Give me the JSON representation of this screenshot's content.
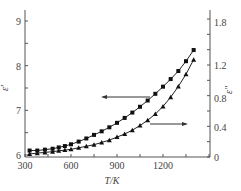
{
  "chart_data": {
    "type": "line",
    "title": "",
    "xlabel": "T/K",
    "ylabel": "ε′",
    "ylabel_right": "ε″",
    "xlim": [
      300,
      1500
    ],
    "ylim": [
      6,
      9.3
    ],
    "ylim_right": [
      0,
      1.9
    ],
    "x_ticks": [
      300,
      600,
      900,
      1200
    ],
    "y_ticks": [
      6,
      7,
      8,
      9
    ],
    "y_ticks_right": [
      0,
      0.4,
      0.8,
      1.2,
      1.8
    ],
    "grid": false,
    "series": [
      {
        "name": "ε′",
        "axis": "left",
        "marker": "square",
        "x": [
          330,
          380,
          430,
          480,
          520,
          560,
          600,
          650,
          700,
          750,
          800,
          850,
          900,
          950,
          1000,
          1050,
          1100,
          1150,
          1200,
          1250,
          1300,
          1350,
          1400
        ],
        "values": [
          6.1,
          6.1,
          6.12,
          6.14,
          6.17,
          6.2,
          6.24,
          6.3,
          6.37,
          6.45,
          6.53,
          6.62,
          6.72,
          6.83,
          6.95,
          7.08,
          7.22,
          7.37,
          7.53,
          7.7,
          7.88,
          8.1,
          8.35
        ]
      },
      {
        "name": "ε″",
        "axis": "right",
        "marker": "triangle",
        "x": [
          330,
          380,
          430,
          480,
          520,
          560,
          600,
          650,
          700,
          750,
          800,
          850,
          900,
          950,
          1000,
          1050,
          1100,
          1150,
          1200,
          1250,
          1300,
          1350,
          1400
        ],
        "values": [
          0.04,
          0.05,
          0.06,
          0.07,
          0.08,
          0.09,
          0.1,
          0.12,
          0.14,
          0.16,
          0.19,
          0.22,
          0.26,
          0.3,
          0.35,
          0.41,
          0.48,
          0.56,
          0.66,
          0.78,
          0.92,
          1.08,
          1.27
        ]
      }
    ],
    "annotations": [
      {
        "type": "arrow",
        "direction": "left",
        "points_to": "ε′ axis",
        "x": 1050,
        "y_left": 7.45
      },
      {
        "type": "arrow",
        "direction": "right",
        "points_to": "ε″ axis",
        "x": 1100,
        "y_right": 0.4
      }
    ]
  },
  "labels": {
    "xlabel": "T/K",
    "ylabel_left": "ε′",
    "ylabel_right": "ε″"
  }
}
